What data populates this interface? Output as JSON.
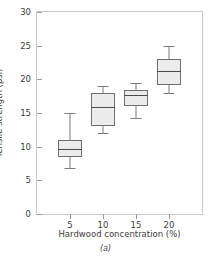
{
  "chart_data": {
    "type": "box",
    "title": "",
    "caption": "(a)",
    "xlabel": "Hardwood concentration (%)",
    "ylabel": "Tensile strength (psi)",
    "categories": [
      "5",
      "10",
      "15",
      "20"
    ],
    "xlim": [
      0,
      25
    ],
    "ylim": [
      0,
      30
    ],
    "yticks": [
      0,
      5,
      10,
      15,
      20,
      25,
      30
    ],
    "ytick_labels": [
      "0",
      "5",
      "10",
      "15",
      "20",
      "25",
      "30"
    ],
    "xticks": [
      5,
      10,
      15,
      20
    ],
    "xtick_labels": [
      "5",
      "10",
      "15",
      "20"
    ],
    "grid": false,
    "legend": null,
    "boxes": [
      {
        "category": "5",
        "x": 5,
        "whisker_low": 6.8,
        "q1": 8.5,
        "median": 9.7,
        "q3": 11.0,
        "whisker_high": 15.0
      },
      {
        "category": "10",
        "x": 10,
        "whisker_low": 12.0,
        "q1": 13.1,
        "median": 15.9,
        "q3": 18.0,
        "whisker_high": 19.0
      },
      {
        "category": "15",
        "x": 15,
        "whisker_low": 14.2,
        "q1": 16.0,
        "median": 17.6,
        "q3": 18.4,
        "whisker_high": 19.4
      },
      {
        "category": "20",
        "x": 20,
        "whisker_low": 18.0,
        "q1": 19.2,
        "median": 21.2,
        "q3": 23.0,
        "whisker_high": 25.0
      }
    ],
    "colors": {
      "box_fill": "#ececec",
      "box_edge": "#6f6f6f",
      "whisker": "#7d7d7d",
      "median": "#4a4a4a",
      "frame": "#c9c9c9",
      "text": "#3c3c3c",
      "background": "#ffffff"
    }
  }
}
